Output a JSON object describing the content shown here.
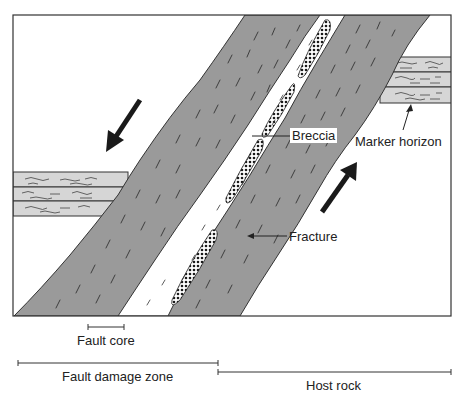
{
  "diagram": {
    "colors": {
      "host_rock_fill": "#ffffff",
      "damage_zone_fill": "#9a9a9a",
      "marker_horizon_fill": "#d6d6d6",
      "breccia_fill": "#ffffff",
      "breccia_dots": "#1a1a1a",
      "outline": "#333333",
      "arrow": "#1a1a1a"
    },
    "labels": {
      "breccia": "Breccia",
      "marker_horizon": "Marker horizon",
      "fracture": "Fracture"
    },
    "scale_bars": {
      "fault_core": "Fault core",
      "fault_damage_zone": "Fault damage zone",
      "host_rock": "Host rock"
    },
    "arrows": [
      {
        "name": "left-block-motion",
        "direction": "down-left"
      },
      {
        "name": "right-block-motion",
        "direction": "up-right"
      }
    ]
  }
}
